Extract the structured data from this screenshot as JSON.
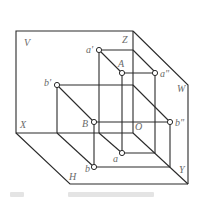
{
  "diagram": {
    "type": "three-plane projection (point projections on V, H, W planes)",
    "colors": {
      "line": "#2a2a2a",
      "label": "#6a6a6a",
      "background": "#ffffff"
    },
    "planes": {
      "V": "V",
      "H": "H",
      "W": "W"
    },
    "axes": {
      "X": "X",
      "Y": "Y",
      "Z": "Z",
      "O": "O"
    },
    "points": {
      "A": "A",
      "B": "B",
      "a_front": "a'",
      "a_side": "a\"",
      "a_top": "a",
      "b_front": "b'",
      "b_side": "b\"",
      "b_top": "b"
    }
  }
}
